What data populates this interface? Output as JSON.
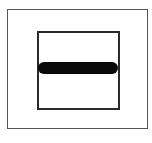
{
  "diagram": {
    "elements": [
      {
        "type": "outer-frame",
        "shape": "rectangle",
        "stroke": "#555555"
      },
      {
        "type": "inner-frame",
        "shape": "square",
        "stroke": "#2a2a2a"
      },
      {
        "type": "bar",
        "shape": "rounded-horizontal-bar",
        "fill": "#0a0a0a",
        "icon": "minus-icon"
      }
    ],
    "colors": {
      "background": "#ffffff",
      "outer_stroke": "#555555",
      "inner_stroke": "#2a2a2a",
      "bar_fill": "#0a0a0a"
    }
  }
}
